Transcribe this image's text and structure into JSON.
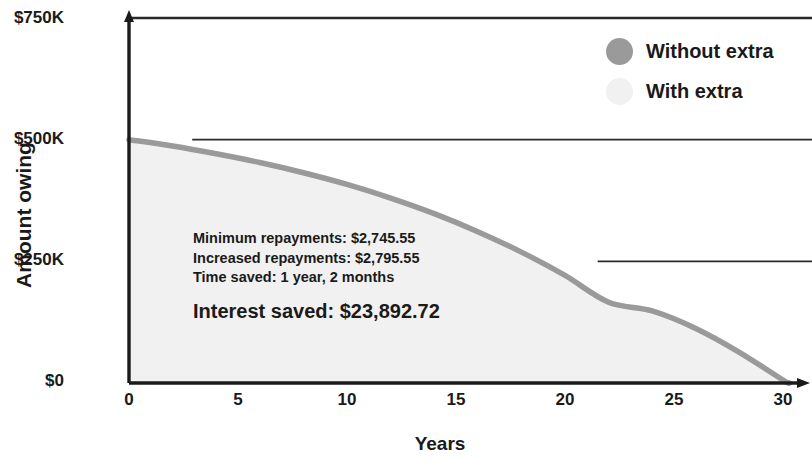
{
  "chart_data": {
    "type": "area",
    "title": "",
    "xlabel": "Years",
    "ylabel": "Amount owing",
    "xlim": [
      0,
      31.5
    ],
    "ylim": [
      0,
      750000
    ],
    "xticks": [
      "0",
      "5",
      "10",
      "15",
      "20",
      "25",
      "30"
    ],
    "xtick_values": [
      0,
      5,
      10,
      15,
      20,
      25,
      30
    ],
    "yticks": [
      "$0",
      "$250K",
      "$500K",
      "$750K"
    ],
    "ytick_values": [
      0,
      250000,
      500000,
      750000
    ],
    "grid": "horizontal-partial",
    "legend_position": "top-right",
    "series": [
      {
        "name": "Without extra",
        "color": "#9a9a9a",
        "style": "line",
        "x": [
          0,
          2,
          4,
          6,
          8,
          10,
          12,
          14,
          16,
          18,
          20,
          22,
          24,
          26,
          28,
          30,
          30.3
        ],
        "values": [
          500000,
          487000,
          471000,
          453000,
          432000,
          408000,
          380000,
          348000,
          311000,
          269000,
          221000,
          166000,
          148000,
          112000,
          63000,
          6000,
          0
        ]
      },
      {
        "name": "With extra",
        "color": "#f1f1f1",
        "style": "area",
        "x": [
          0,
          2,
          4,
          6,
          8,
          10,
          12,
          14,
          16,
          18,
          20,
          22,
          24,
          26,
          28,
          29.1
        ],
        "values": [
          500000,
          486000,
          469000,
          450000,
          428000,
          403000,
          374000,
          341000,
          302000,
          258000,
          208000,
          151000,
          130000,
          92000,
          42000,
          0
        ]
      }
    ],
    "reference_lines": [
      {
        "y": 750000,
        "x_start": 0,
        "x_end": 31.5,
        "color": "#2a2a2a"
      },
      {
        "y": 500000,
        "x_start": 2.9,
        "x_end": 31.5,
        "color": "#2a2a2a"
      },
      {
        "y": 250000,
        "x_start": 21.5,
        "x_end": 31.5,
        "color": "#2a2a2a"
      }
    ],
    "annotations": {
      "minimum_repayments": "Minimum repayments: $2,745.55",
      "increased_repayments": "Increased repayments: $2,795.55",
      "time_saved": "Time saved: 1 year, 2 months",
      "interest_saved": "Interest saved: $23,892.72"
    }
  },
  "axes": {
    "ylabel": "Amount owing",
    "xlabel": "Years",
    "yticks": [
      {
        "label": "$750K"
      },
      {
        "label": "$500K"
      },
      {
        "label": "$250K"
      },
      {
        "label": "$0"
      }
    ],
    "xticks": [
      {
        "label": "0"
      },
      {
        "label": "5"
      },
      {
        "label": "10"
      },
      {
        "label": "15"
      },
      {
        "label": "20"
      },
      {
        "label": "25"
      },
      {
        "label": "30"
      }
    ]
  },
  "legend": {
    "items": [
      {
        "label": "Without extra",
        "color": "#9a9a9a"
      },
      {
        "label": "With extra",
        "color": "#f1f1f1"
      }
    ]
  },
  "annotation": {
    "line1": "Minimum repayments: $2,745.55",
    "line2": "Increased repayments: $2,795.55",
    "line3": "Time saved: 1 year, 2 months",
    "highlight": "Interest saved: $23,892.72"
  }
}
